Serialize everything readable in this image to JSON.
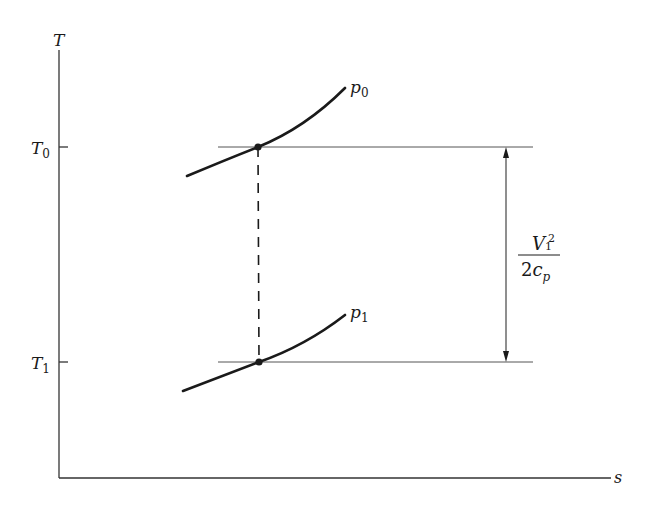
{
  "diagram": {
    "axes": {
      "y_label": "T",
      "x_label": "s",
      "ticks": [
        {
          "name": "T0",
          "main": "T",
          "sub": "0"
        },
        {
          "name": "T1",
          "main": "T",
          "sub": "1"
        }
      ]
    },
    "curves": [
      {
        "name": "p0",
        "main": "p",
        "sub": "0"
      },
      {
        "name": "p1",
        "main": "p",
        "sub": "1"
      }
    ],
    "dimension": {
      "numerator_main": "V",
      "numerator_sup": "2",
      "numerator_sub": "1",
      "denominator_coef": "2",
      "denominator_main": "c",
      "denominator_sub": "p"
    },
    "colors": {
      "ink": "#1a1a1a",
      "thin": "#555555",
      "background": "#ffffff"
    }
  }
}
